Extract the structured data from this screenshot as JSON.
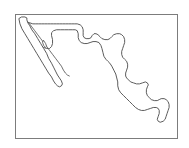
{
  "figure": {
    "kind": "outline-map",
    "has_labels": false,
    "has_title": false,
    "has_legend": false,
    "background_color": "#ffffff"
  },
  "frame": {
    "visible": true,
    "border_color": "#7c7c7c",
    "border_width_px": 1,
    "fill_color": "#ffffff",
    "x": 15,
    "y": 14,
    "width": 163,
    "height": 125
  },
  "map": {
    "outline_color": "#4a4a4a",
    "fill_color": "#ffffff",
    "stroke_width": 0.9,
    "viewbox": "0 0 163 125",
    "regions": [
      {
        "name": "mexico-mainland",
        "description": "Mainland Mexico including Gulf coast, Pacific coast, Yucatan peninsula and northern border",
        "path": "M 2 2 L 3 9 L 7 16 L 9 22 L 14 29 L 18 34 L 23 40 L 28 46 L 33 52 L 37 57 L 41 60 L 44 61 L 46 60 L 47 57 L 46 54 L 45 51 L 46 50 L 48 52 L 50 57 L 52 63 L 54 69 L 57 75 L 61 81 L 65 87 L 70 93 L 76 99 L 82 104 L 88 108 L 94 111 L 100 113 L 106 114 L 111 114 L 116 113 L 120 111 L 124 110 L 127 110 L 129 112 L 130 115 L 131 118 L 133 120 L 136 120 L 139 118 L 141 115 L 143 112 L 145 110 L 148 109 L 150 107 L 152 104 L 153 101 L 153 98 L 152 95 L 150 93 L 149 90 L 150 88 L 152 87 L 155 87 L 157 85 L 158 82 L 158 78 L 157 75 L 155 73 L 152 72 L 149 72 L 146 73 L 143 74 L 140 74 L 137 73 L 134 71 L 131 69 L 128 66 L 126 63 L 124 60 L 122 57 L 121 54 L 120 50 L 119 46 L 119 42 L 120 38 L 121 34 L 121 30 L 120 26 L 118 23 L 115 21 L 112 20 L 109 21 L 106 23 L 103 25 L 100 26 L 97 26 L 94 25 L 91 23 L 88 21 L 85 19 L 82 18 L 79 18 L 76 19 L 73 20 L 70 20 L 67 19 L 64 17 L 61 15 L 58 14 L 55 14 L 52 15 L 49 15 L 46 14 L 44 12 L 42 10 L 40 8 L 38 6 L 36 4 L 34 2 L 31 1 L 27 1 L 22 1 L 16 1 L 10 1 L 5 1 Z"
      },
      {
        "name": "baja-california-peninsula",
        "description": "Baja California peninsula, long narrow landmass on the northwest, separated by the Gulf of California",
        "path": "M 3 3 L 5 8 L 8 14 L 12 21 L 16 28 L 20 35 L 24 42 L 28 48 L 32 54 L 35 58 L 37 61 L 39 63 L 41 64 L 42 63 L 42 61 L 40 58 L 37 54 L 34 49 L 31 44 L 28 39 L 25 34 L 22 29 L 19 24 L 16 19 L 14 15 L 12 12 L 11 9 L 11 6 L 12 4 L 13 2 L 11 1 L 8 1 L 5 1 Z"
      }
    ]
  }
}
